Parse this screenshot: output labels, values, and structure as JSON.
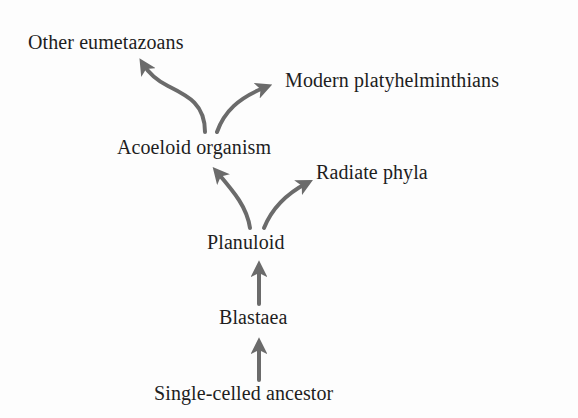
{
  "diagram": {
    "type": "phylogeny-flow",
    "arrow_color": "#6b6b6b",
    "text_color": "#1e1e1e",
    "nodes": [
      {
        "id": "other_eumetazoans",
        "label": "Other eumetazoans"
      },
      {
        "id": "modern_platyhelminthians",
        "label": "Modern platyhelminthians"
      },
      {
        "id": "acoeloid_organism",
        "label": "Acoeloid organism"
      },
      {
        "id": "radiate_phyla",
        "label": "Radiate phyla"
      },
      {
        "id": "planuloid",
        "label": "Planuloid"
      },
      {
        "id": "blastaea",
        "label": "Blastaea"
      },
      {
        "id": "single_celled_ancestor",
        "label": "Single-celled ancestor"
      }
    ],
    "edges": [
      {
        "from": "single_celled_ancestor",
        "to": "blastaea"
      },
      {
        "from": "blastaea",
        "to": "planuloid"
      },
      {
        "from": "planuloid",
        "to": "acoeloid_organism"
      },
      {
        "from": "planuloid",
        "to": "radiate_phyla"
      },
      {
        "from": "acoeloid_organism",
        "to": "other_eumetazoans"
      },
      {
        "from": "acoeloid_organism",
        "to": "modern_platyhelminthians"
      }
    ]
  }
}
